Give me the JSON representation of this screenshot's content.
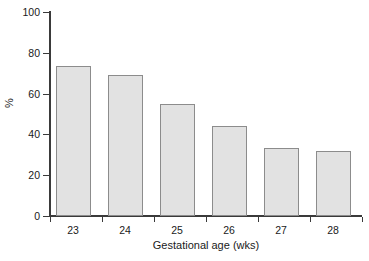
{
  "chart_data": {
    "type": "bar",
    "title": "",
    "subtitle": "",
    "categories": [
      "23",
      "24",
      "25",
      "26",
      "27",
      "28"
    ],
    "values": [
      73.5,
      69,
      55,
      44,
      33.5,
      32
    ],
    "xlabel": "Gestational age (wks)",
    "ylabel": "%",
    "ylim": [
      0,
      100
    ],
    "yticks": [
      0,
      20,
      40,
      60,
      80,
      100
    ],
    "ytick_labels": [
      "0",
      "20",
      "40",
      "60",
      "80",
      "100"
    ],
    "grid": false,
    "legend": null,
    "annotations": [],
    "style": {
      "bar_fill": "#e2e2e2",
      "bar_border": "#8c8c8c",
      "axis_color": "#3a3a3a",
      "background": "#ffffff",
      "text_color": "#1a1a1a"
    }
  }
}
